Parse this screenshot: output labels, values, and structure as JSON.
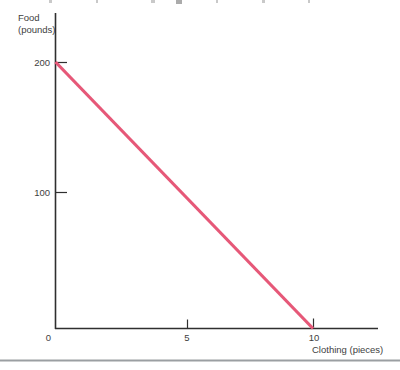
{
  "chart_data": {
    "type": "line",
    "title": "",
    "xlabel": "Clothing (pieces)",
    "ylabel": "Food (pounds)",
    "x_ticks": [
      0,
      5,
      10
    ],
    "y_ticks": [
      100,
      200
    ],
    "xlim": [
      0,
      12.5
    ],
    "ylim": [
      0,
      245
    ],
    "grid": false,
    "legend_position": "none",
    "series": [
      {
        "name": "budget-line",
        "type": "line",
        "color": "#e65878",
        "points": [
          {
            "x": 0,
            "y": 200
          },
          {
            "x": 10,
            "y": 0
          }
        ]
      }
    ]
  },
  "labels": {
    "y_axis_title_line1": "Food",
    "y_axis_title_line2": "(pounds)",
    "x_axis_title": "Clothing (pieces)",
    "y_tick_200": "200",
    "y_tick_100": "100",
    "origin_tick": "0",
    "x_tick_5": "5",
    "x_tick_10": "10"
  },
  "colors": {
    "line": "#e65878",
    "axis": "#2f2f2f",
    "text": "#3e3e3e",
    "bottom_rule": "#9b9fa2",
    "cropped_text_fragment": "#c9c9c9"
  }
}
